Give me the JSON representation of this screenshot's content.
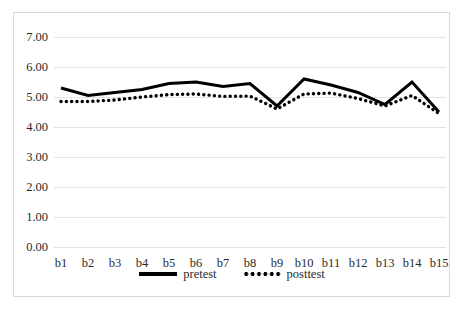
{
  "chart_data": {
    "type": "line",
    "title": "",
    "xlabel": "",
    "ylabel": "",
    "categories": [
      "b1",
      "b2",
      "b3",
      "b4",
      "b5",
      "b6",
      "b7",
      "b8",
      "b9",
      "b10",
      "b11",
      "b12",
      "b13",
      "b14",
      "b15"
    ],
    "series": [
      {
        "name": "pretest",
        "style": "solid",
        "color": "#000000",
        "values": [
          5.3,
          5.05,
          5.15,
          5.25,
          5.45,
          5.5,
          5.35,
          5.45,
          4.7,
          5.6,
          5.4,
          5.15,
          4.75,
          5.5,
          4.5
        ]
      },
      {
        "name": "posttest",
        "style": "dotted",
        "color": "#000000",
        "values": [
          4.85,
          4.85,
          4.9,
          5.0,
          5.08,
          5.1,
          5.02,
          5.03,
          4.6,
          5.1,
          5.13,
          4.95,
          4.7,
          5.05,
          4.45
        ]
      }
    ],
    "ylim": [
      0.0,
      7.0
    ],
    "ytick_labels": [
      "7.00",
      "6.00",
      "5.00",
      "4.00",
      "3.00",
      "2.00",
      "1.00",
      "0.00"
    ],
    "ytick_values": [
      7.0,
      6.0,
      5.0,
      4.0,
      3.0,
      2.0,
      1.0,
      0.0
    ],
    "grid": true,
    "grid_color": "#e3e3e3",
    "legend_position": "bottom",
    "border_color": "#d8d8d8",
    "background": "#ffffff"
  }
}
